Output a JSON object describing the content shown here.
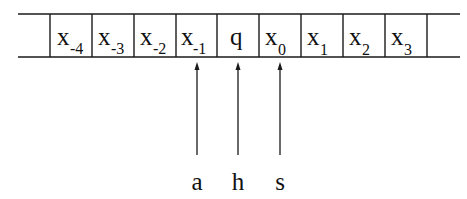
{
  "diagram": {
    "tape": {
      "cells": [
        {
          "symbol": "",
          "sub": ""
        },
        {
          "symbol": "x",
          "sub": "-4"
        },
        {
          "symbol": "x",
          "sub": "-3"
        },
        {
          "symbol": "x",
          "sub": "-2"
        },
        {
          "symbol": "x",
          "sub": "-1"
        },
        {
          "symbol": "q",
          "sub": ""
        },
        {
          "symbol": "x",
          "sub": "0"
        },
        {
          "symbol": "x",
          "sub": "1"
        },
        {
          "symbol": "x",
          "sub": "2"
        },
        {
          "symbol": "x",
          "sub": "3"
        },
        {
          "symbol": "",
          "sub": ""
        }
      ]
    },
    "pointers": [
      {
        "label": "a",
        "points_to_cell": "x-1"
      },
      {
        "label": "h",
        "points_to_cell": "q"
      },
      {
        "label": "s",
        "points_to_cell": "x0"
      }
    ],
    "colors": {
      "stroke": "#1a1a1a",
      "background": "#ffffff"
    }
  }
}
